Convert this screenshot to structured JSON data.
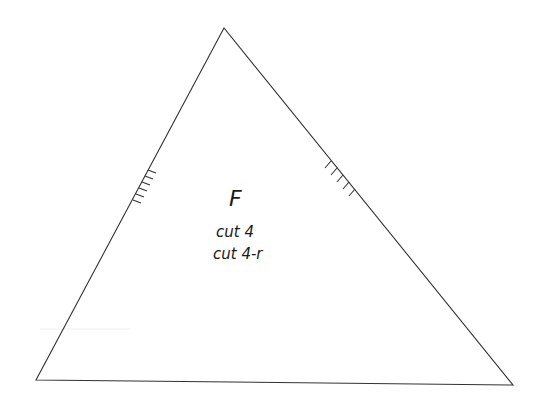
{
  "pattern_piece": {
    "label": "F",
    "instructions": [
      "cut 4",
      "cut 4-r"
    ],
    "shape": "triangle",
    "vertices": {
      "apex": [
        224,
        28
      ],
      "bottom_left": [
        36,
        380
      ],
      "bottom_right": [
        513,
        385
      ]
    },
    "notches": {
      "left_edge": {
        "count": 6
      },
      "right_edge": {
        "count": 5
      }
    },
    "line_color": "#333333"
  }
}
